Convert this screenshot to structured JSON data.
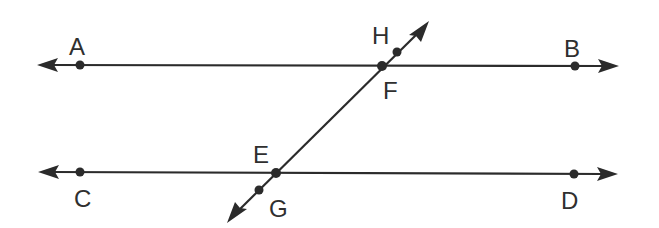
{
  "diagram": {
    "colors": {
      "stroke": "#2b2b2b",
      "label": "#2f2f2f",
      "background": "#ffffff"
    },
    "lines": [
      {
        "id": "line-ab",
        "name": "AB",
        "type": "line",
        "arrows": "both"
      },
      {
        "id": "line-cd",
        "name": "CD",
        "type": "line",
        "arrows": "both"
      },
      {
        "id": "transversal",
        "name": "HG",
        "type": "line",
        "arrows": "both"
      }
    ],
    "points": {
      "A": {
        "label": "A",
        "on": "AB"
      },
      "B": {
        "label": "B",
        "on": "AB"
      },
      "C": {
        "label": "C",
        "on": "CD"
      },
      "D": {
        "label": "D",
        "on": "CD"
      },
      "E": {
        "label": "E",
        "on": "CD and transversal (intersection)"
      },
      "F": {
        "label": "F",
        "on": "AB and transversal (intersection)"
      },
      "G": {
        "label": "G",
        "on": "transversal"
      },
      "H": {
        "label": "H",
        "on": "transversal"
      }
    }
  }
}
